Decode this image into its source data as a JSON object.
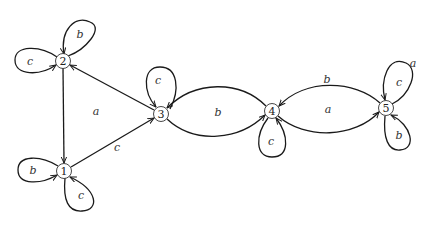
{
  "diagram": {
    "type": "state-transition-graph",
    "nodes": [
      {
        "id": "1",
        "label": "1",
        "x": 64,
        "y": 171
      },
      {
        "id": "2",
        "label": "2",
        "x": 63,
        "y": 61
      },
      {
        "id": "3",
        "label": "3",
        "x": 161,
        "y": 114
      },
      {
        "id": "4",
        "label": "4",
        "x": 272,
        "y": 111
      },
      {
        "id": "5",
        "label": "5",
        "x": 386,
        "y": 108
      }
    ],
    "edges": [
      {
        "from": "2",
        "to": "1",
        "label": ""
      },
      {
        "from": "3",
        "to": "2",
        "label": "a"
      },
      {
        "from": "1",
        "to": "3",
        "label": "c"
      },
      {
        "from": "3",
        "to": "4",
        "label": "b"
      },
      {
        "from": "4",
        "to": "3",
        "label": ""
      },
      {
        "from": "4",
        "to": "5",
        "label": "a"
      },
      {
        "from": "5",
        "to": "4",
        "label": "b"
      },
      {
        "from": "1",
        "to": "1",
        "label": "b"
      },
      {
        "from": "1",
        "to": "1",
        "label": "c"
      },
      {
        "from": "2",
        "to": "2",
        "label": "b"
      },
      {
        "from": "2",
        "to": "2",
        "label": "c"
      },
      {
        "from": "3",
        "to": "3",
        "label": "c"
      },
      {
        "from": "4",
        "to": "4",
        "label": "c"
      },
      {
        "from": "5",
        "to": "5",
        "label": "c"
      },
      {
        "from": "5",
        "to": "5",
        "label": "b"
      }
    ],
    "labels": {
      "n1": "1",
      "n2": "2",
      "n3": "3",
      "n4": "4",
      "n5": "5",
      "e32": "a",
      "e13": "c",
      "e34": "b",
      "e45": "a",
      "e54": "b",
      "loop1_left": "b",
      "loop1_bottom": "c",
      "loop2_top": "b",
      "loop2_left": "c",
      "loop3_top": "c",
      "loop4_bottom": "c",
      "loop5_top": "c",
      "loop5_top_extra": "a",
      "loop5_bottom": "b"
    }
  }
}
